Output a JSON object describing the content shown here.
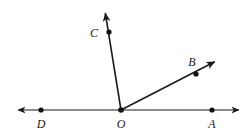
{
  "figure": {
    "kind": "geometry-diagram",
    "width": 252,
    "height": 136,
    "background_color": "#ffffff",
    "stroke_color": "#1a1a1a",
    "line_width": 1.1,
    "ray_line_width": 1.6,
    "dot_radius": 2.6,
    "dot_color": "#111111",
    "label_color": "#1a1a1a",
    "label_font_size": 12,
    "labels": [
      {
        "id": "C",
        "text": "C",
        "x": 94,
        "y": 33
      },
      {
        "id": "B",
        "text": "B",
        "x": 192,
        "y": 62
      },
      {
        "id": "D",
        "text": "D",
        "x": 41,
        "y": 124
      },
      {
        "id": "O",
        "text": "O",
        "x": 121,
        "y": 124
      },
      {
        "id": "A",
        "text": "A",
        "x": 212,
        "y": 124
      }
    ],
    "points": [
      {
        "id": "O",
        "x": 121,
        "y": 110,
        "role": "vertex"
      },
      {
        "id": "D",
        "x": 41,
        "y": 110,
        "role": "on-line"
      },
      {
        "id": "A",
        "x": 212,
        "y": 110,
        "role": "on-line"
      },
      {
        "id": "C",
        "x": 109,
        "y": 32,
        "role": "on-ray"
      },
      {
        "id": "B",
        "x": 196,
        "y": 74,
        "role": "on-ray"
      }
    ],
    "line": {
      "id": "line-DA",
      "x1": 11,
      "y1": 110,
      "x2": 246,
      "y2": 110,
      "arrows": "both"
    },
    "rays": [
      {
        "id": "ray-OC",
        "x1": 121,
        "y1": 110,
        "x2": 104,
        "y2": 5,
        "arrow": "end"
      },
      {
        "id": "ray-OB",
        "x1": 121,
        "y1": 110,
        "x2": 222,
        "y2": 58,
        "arrow": "end"
      }
    ]
  },
  "chart_data": {
    "type": "diagram",
    "title": "",
    "annotations": [
      "C",
      "B",
      "D",
      "O",
      "A"
    ]
  }
}
